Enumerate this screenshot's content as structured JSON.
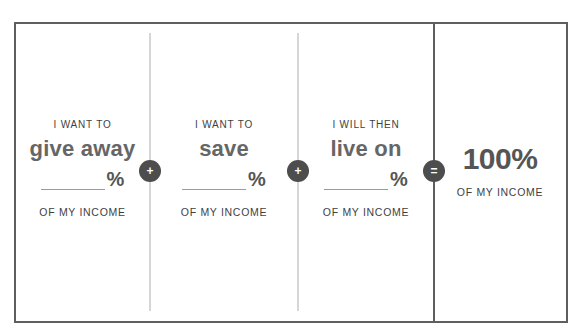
{
  "columns": [
    {
      "lead": "I WANT TO",
      "verb": "give away",
      "percent_symbol": "%",
      "tail": "OF MY INCOME"
    },
    {
      "lead": "I WANT TO",
      "verb": "save",
      "percent_symbol": "%",
      "tail": "OF MY INCOME"
    },
    {
      "lead": "I WILL THEN",
      "verb": "live on",
      "percent_symbol": "%",
      "tail": "OF MY INCOME"
    }
  ],
  "operators": [
    {
      "symbol": "+",
      "icon": "plus-icon"
    },
    {
      "symbol": "+",
      "icon": "plus-icon"
    },
    {
      "symbol": "=",
      "icon": "equals-icon"
    }
  ],
  "total": {
    "value": "100%",
    "tail": "OF MY INCOME"
  },
  "colors": {
    "border": "#5f5f5f",
    "divider": "#d6d6d6",
    "operator_bg": "#4d4d4d",
    "text": "#4a4a4a"
  }
}
